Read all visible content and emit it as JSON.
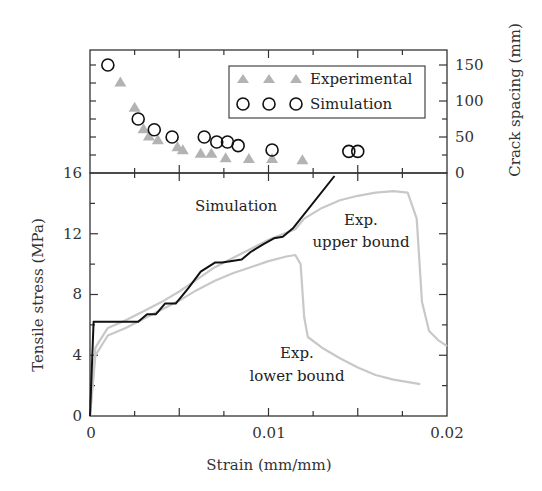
{
  "chart_data": [
    {
      "panel": "top",
      "type": "scatter",
      "title": "",
      "xlabel": "",
      "ylabel": "Crack spacing (mm)",
      "y_axis_side": "right",
      "xlim": [
        0,
        0.02
      ],
      "ylim": [
        0,
        165
      ],
      "yticks": [
        "0",
        "50",
        "100",
        "150"
      ],
      "grid": false,
      "legend_position": "upper right (boxed)",
      "series": [
        {
          "name": "Experimental",
          "marker": "triangle",
          "color": "#b3b3b3",
          "x": [
            0.0017,
            0.0025,
            0.003,
            0.0033,
            0.0038,
            0.0049,
            0.0052,
            0.0062,
            0.0068,
            0.0076,
            0.0089,
            0.0102,
            0.0119
          ],
          "y": [
            127,
            92,
            62,
            52,
            47,
            37,
            33,
            28,
            28,
            22,
            21,
            21,
            19
          ]
        },
        {
          "name": "Simulation",
          "marker": "circle-open",
          "color": "#111111",
          "x": [
            0.001,
            0.0027,
            0.0036,
            0.0046,
            0.0064,
            0.0071,
            0.0077,
            0.0083,
            0.0102,
            0.0145,
            0.015
          ],
          "y": [
            150,
            75,
            60,
            50,
            50,
            43,
            43,
            38,
            32,
            30,
            30
          ]
        }
      ]
    },
    {
      "panel": "bottom",
      "type": "line",
      "title": "",
      "xlabel": "Strain (mm/mm)",
      "ylabel": "Tensile stress (MPa)",
      "xlim": [
        0,
        0.02
      ],
      "ylim": [
        0,
        16
      ],
      "xticks": [
        "0",
        "0.01",
        "0.02"
      ],
      "yticks": [
        "0",
        "4",
        "8",
        "12",
        "16"
      ],
      "grid": false,
      "series": [
        {
          "name": "Simulation",
          "color": "#111111",
          "x": [
            0,
            0.0002,
            0.0003,
            0.0027,
            0.0032,
            0.0037,
            0.0042,
            0.0048,
            0.0055,
            0.0062,
            0.007,
            0.0074,
            0.0085,
            0.009,
            0.0097,
            0.0103,
            0.0108,
            0.0114,
            0.0137
          ],
          "y": [
            0,
            6.2,
            6.2,
            6.2,
            6.7,
            6.7,
            7.4,
            7.4,
            8.4,
            9.5,
            10.1,
            10.1,
            10.3,
            10.8,
            11.3,
            11.7,
            11.8,
            12.4,
            15.8
          ]
        },
        {
          "name": "Exp. upper bound",
          "color": "#c8c8c8",
          "x": [
            0,
            0.0003,
            0.001,
            0.002,
            0.003,
            0.004,
            0.005,
            0.006,
            0.007,
            0.008,
            0.009,
            0.01,
            0.0115,
            0.012,
            0.013,
            0.014,
            0.015,
            0.016,
            0.017,
            0.0178,
            0.0183,
            0.0186,
            0.019,
            0.0195,
            0.02
          ],
          "y": [
            0,
            4.5,
            5.8,
            6.3,
            6.9,
            7.5,
            8.2,
            9.0,
            9.8,
            10.4,
            11.0,
            11.6,
            12.3,
            13.0,
            13.7,
            14.2,
            14.5,
            14.7,
            14.8,
            14.7,
            13.0,
            7.5,
            5.6,
            5.0,
            4.6
          ]
        },
        {
          "name": "Exp. lower bound",
          "color": "#c8c8c8",
          "x": [
            0,
            0.0003,
            0.001,
            0.002,
            0.003,
            0.004,
            0.005,
            0.006,
            0.007,
            0.008,
            0.009,
            0.01,
            0.011,
            0.0115,
            0.0118,
            0.012,
            0.0122,
            0.013,
            0.014,
            0.015,
            0.016,
            0.017,
            0.018,
            0.0185
          ],
          "y": [
            0,
            4.0,
            5.3,
            5.8,
            6.4,
            7.0,
            7.6,
            8.3,
            8.9,
            9.4,
            9.8,
            10.2,
            10.5,
            10.6,
            10.0,
            6.5,
            5.2,
            4.5,
            3.8,
            3.2,
            2.7,
            2.4,
            2.2,
            2.1
          ]
        }
      ],
      "annotations": [
        "Simulation",
        "Exp.",
        "upper bound",
        "Exp.",
        "lower bound"
      ]
    }
  ],
  "legend": {
    "experimental_label": "Experimental",
    "simulation_label": "Simulation"
  },
  "labels": {
    "top_ylabel": "Crack spacing (mm)",
    "bottom_ylabel": "Tensile stress (MPa)",
    "xlabel": "Strain (mm/mm)",
    "annot_sim": "Simulation",
    "annot_upper_1": "Exp.",
    "annot_upper_2": "upper bound",
    "annot_lower_1": "Exp.",
    "annot_lower_2": "lower bound"
  },
  "ticks": {
    "y_left": [
      "0",
      "4",
      "8",
      "12",
      "16"
    ],
    "y_right": [
      "0",
      "50",
      "100",
      "150"
    ],
    "x": [
      "0",
      "0.01",
      "0.02"
    ]
  }
}
